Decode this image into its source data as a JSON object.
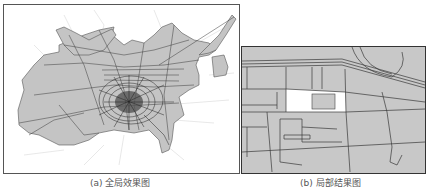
{
  "figure": {
    "panels": [
      {
        "id": "a",
        "caption": "(a) 全局效果图",
        "content": "global road network map with gray regions"
      },
      {
        "id": "b",
        "caption": "(b) 局部结果图",
        "content": "local detail map with highlighted white parcel"
      }
    ]
  },
  "colors": {
    "region_fill": "#c4c4c4",
    "road_line": "#3a3a3a",
    "highlight": "#ffffff",
    "frame": "#555555"
  }
}
